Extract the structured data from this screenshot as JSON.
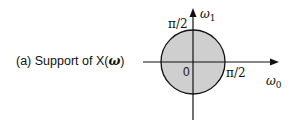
{
  "caption": {
    "prefix": "(a)  Support of X(",
    "symbol": "ω",
    "suffix": ")"
  },
  "diagram": {
    "vertical_axis_label": "ω",
    "vertical_axis_subscript": "1",
    "horizontal_axis_label": "ω",
    "horizontal_axis_subscript": "0",
    "origin_label": "0",
    "top_tick_label": "π/2",
    "right_tick_label": "π/2",
    "region_fill": "#cfcfcf",
    "stroke_color": "#111111"
  }
}
